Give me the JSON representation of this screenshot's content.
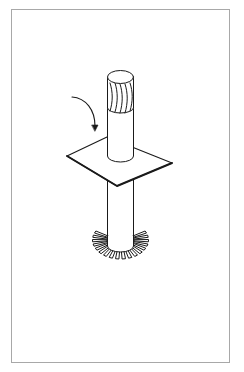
{
  "figure": {
    "colors": {
      "stroke": "#1a1a1a",
      "frame": "#a8a8a8",
      "background": "#ffffff",
      "fill": "#ffffff"
    },
    "components": [
      {
        "id": "shaft-top",
        "label": "upper shaft with hatched grip"
      },
      {
        "id": "plate",
        "label": "square plate"
      },
      {
        "id": "shaft-bottom",
        "label": "lower shaft"
      },
      {
        "id": "gear-ring",
        "label": "bevel gear teeth ring",
        "teeth": 18
      },
      {
        "id": "rotation-arrow",
        "label": "curved rotation arrow"
      }
    ]
  }
}
